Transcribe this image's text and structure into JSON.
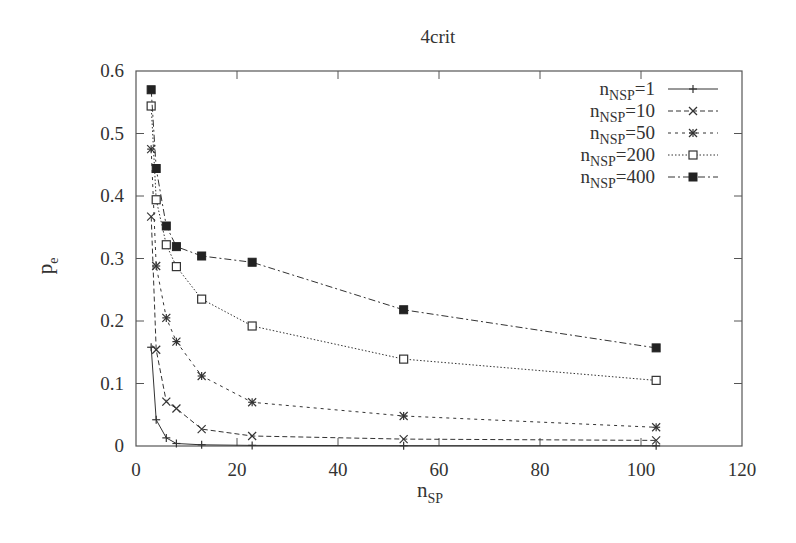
{
  "chart_data": {
    "type": "line",
    "title": "4crit",
    "xlabel": "n_SP",
    "xlabel_main": "n",
    "xlabel_sub": "SP",
    "ylabel": "p_e",
    "ylabel_main": "p",
    "ylabel_sub": "e",
    "xlim": [
      0,
      120
    ],
    "ylim": [
      0,
      0.6
    ],
    "xticks": [
      0,
      20,
      40,
      60,
      80,
      100,
      120
    ],
    "xtick_labels": [
      "0",
      "20",
      "40",
      "60",
      "80",
      "100",
      "120"
    ],
    "yticks": [
      0,
      0.1,
      0.2,
      0.3,
      0.4,
      0.5,
      0.6
    ],
    "ytick_labels": [
      "0",
      "0.1",
      "0.2",
      "0.3",
      "0.4",
      "0.5",
      "0.6"
    ],
    "grid": false,
    "legend_position": "top-right (inside)",
    "x": [
      3,
      4,
      6,
      8,
      13,
      23,
      53,
      103
    ],
    "series": [
      {
        "name": "n_NSP=1",
        "label_main": "n",
        "label_sub": "NSP",
        "label_suffix": "=1",
        "marker": "plus",
        "line": "solid",
        "values": [
          0.158,
          0.042,
          0.013,
          0.004,
          0.002,
          0.001,
          0.0005,
          0.0003
        ]
      },
      {
        "name": "n_NSP=10",
        "label_main": "n",
        "label_sub": "NSP",
        "label_suffix": "=10",
        "marker": "cross",
        "line": "dashed",
        "values": [
          0.367,
          0.154,
          0.071,
          0.06,
          0.027,
          0.016,
          0.011,
          0.009
        ]
      },
      {
        "name": "n_NSP=50",
        "label_main": "n",
        "label_sub": "NSP",
        "label_suffix": "=50",
        "marker": "star",
        "line": "dotted-short",
        "values": [
          0.475,
          0.288,
          0.205,
          0.167,
          0.112,
          0.07,
          0.048,
          0.03
        ]
      },
      {
        "name": "n_NSP=200",
        "label_main": "n",
        "label_sub": "NSP",
        "label_suffix": "=200",
        "marker": "open-square",
        "line": "dotted",
        "values": [
          0.544,
          0.394,
          0.322,
          0.287,
          0.235,
          0.192,
          0.139,
          0.105
        ]
      },
      {
        "name": "n_NSP=400",
        "label_main": "n",
        "label_sub": "NSP",
        "label_suffix": "=400",
        "marker": "filled-square",
        "line": "dash-dot",
        "values": [
          0.57,
          0.444,
          0.352,
          0.319,
          0.304,
          0.294,
          0.218,
          0.157
        ]
      }
    ]
  },
  "style": {
    "ink": "#333333",
    "frame": "#555555",
    "background": "#ffffff"
  }
}
